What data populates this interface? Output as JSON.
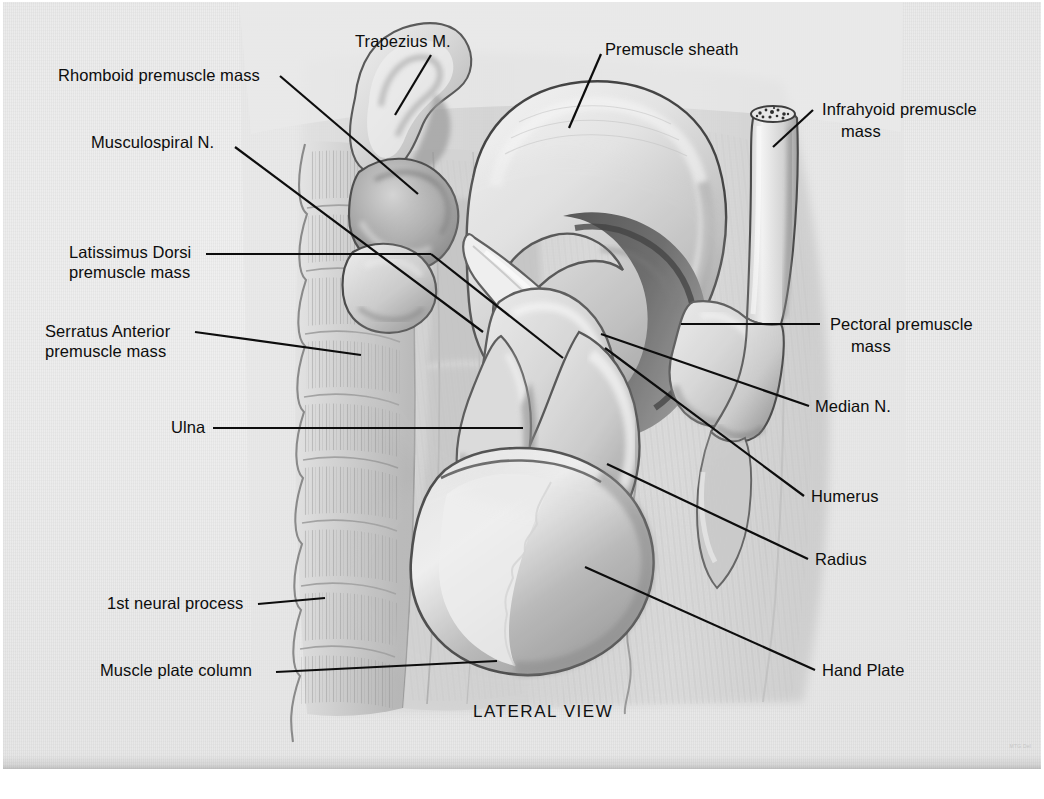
{
  "figure": {
    "view_caption": "LATERAL VIEW",
    "artist_mark": "MTG Del",
    "bottom_caption": " "
  },
  "labels": {
    "left": [
      {
        "id": "rhomboid",
        "text": "Rhomboid premuscle mass"
      },
      {
        "id": "musculospiral",
        "text": "Musculospiral N."
      },
      {
        "id": "latissimus_l1",
        "text": "Latissimus Dorsi"
      },
      {
        "id": "latissimus_l2",
        "text": "premuscle mass"
      },
      {
        "id": "serratus_l1",
        "text": "Serratus Anterior"
      },
      {
        "id": "serratus_l2",
        "text": "premuscle mass"
      },
      {
        "id": "ulna",
        "text": "Ulna"
      },
      {
        "id": "neural_process",
        "text": "1st neural process"
      },
      {
        "id": "muscle_plate",
        "text": "Muscle plate column"
      }
    ],
    "top": [
      {
        "id": "trapezius",
        "text": "Trapezius M."
      },
      {
        "id": "premuscle_sheath",
        "text": "Premuscle sheath"
      }
    ],
    "right": [
      {
        "id": "infrahyoid_l1",
        "text": "Infrahyoid premuscle"
      },
      {
        "id": "infrahyoid_l2",
        "text": "mass"
      },
      {
        "id": "pectoral_l1",
        "text": "Pectoral premuscle"
      },
      {
        "id": "pectoral_l2",
        "text": "mass"
      },
      {
        "id": "median",
        "text": "Median N."
      },
      {
        "id": "humerus",
        "text": "Humerus"
      },
      {
        "id": "radius",
        "text": "Radius"
      },
      {
        "id": "hand_plate",
        "text": "Hand Plate"
      }
    ]
  },
  "colors": {
    "paper": "#ececec",
    "ink": "#0d0d0d",
    "wash_light": "#e0e0e0",
    "wash_mid": "#b4b4b4",
    "wash_dark": "#8a8a8a",
    "wash_deep": "#4a4a4a",
    "outline": "#2c2c2c"
  }
}
